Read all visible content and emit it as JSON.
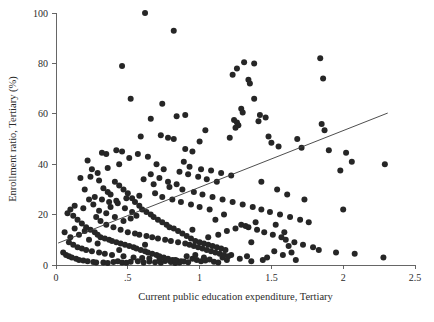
{
  "chart_data": {
    "type": "scatter",
    "title": "",
    "xlabel": "Current public education expenditure, Tertiary",
    "ylabel": "Enrollment ratio, Tertiary (%)",
    "xlim": [
      0,
      2.5
    ],
    "ylim": [
      0,
      100
    ],
    "xticks": [
      0,
      0.5,
      1,
      1.5,
      2,
      2.5
    ],
    "xtick_labels": [
      "0",
      ".5",
      "1",
      "1.5",
      "2",
      "2.5"
    ],
    "yticks": [
      0,
      20,
      40,
      60,
      80,
      100
    ],
    "ytick_labels": [
      "0",
      "20",
      "40",
      "60",
      "80",
      "100"
    ],
    "grid": false,
    "legend": null,
    "marker_color": "#262626",
    "fit_line_color": "#3a3a3a",
    "fit_line": {
      "label": "linear fit",
      "x0": 0.015,
      "y0": 8.7,
      "x1": 2.31,
      "y1": 60.3
    },
    "n_points": 305,
    "points": [
      [
        0.62,
        100.0
      ],
      [
        0.46,
        79.0
      ],
      [
        0.82,
        93.0
      ],
      [
        0.52,
        66.0
      ],
      [
        1.31,
        80.5
      ],
      [
        1.38,
        80.0
      ],
      [
        1.26,
        78.0
      ],
      [
        1.23,
        75.5
      ],
      [
        1.34,
        73.5
      ],
      [
        1.35,
        72.0
      ],
      [
        1.84,
        82.0
      ],
      [
        1.86,
        74.0
      ],
      [
        0.74,
        64.0
      ],
      [
        0.9,
        59.5
      ],
      [
        0.66,
        58.0
      ],
      [
        0.84,
        59.0
      ],
      [
        1.38,
        66.0
      ],
      [
        1.29,
        62.0
      ],
      [
        1.3,
        60.5
      ],
      [
        1.42,
        59.5
      ],
      [
        1.46,
        58.5
      ],
      [
        1.24,
        57.5
      ],
      [
        1.26,
        56.5
      ],
      [
        1.27,
        55.5
      ],
      [
        1.25,
        54.5
      ],
      [
        1.41,
        57.0
      ],
      [
        0.59,
        51.0
      ],
      [
        0.73,
        51.5
      ],
      [
        0.78,
        50.5
      ],
      [
        0.82,
        50.0
      ],
      [
        1.21,
        50.5
      ],
      [
        1.48,
        51.0
      ],
      [
        1.5,
        48.5
      ],
      [
        1.04,
        53.5
      ],
      [
        1.0,
        49.0
      ],
      [
        0.42,
        45.5
      ],
      [
        0.46,
        45.0
      ],
      [
        0.32,
        44.5
      ],
      [
        0.35,
        44.0
      ],
      [
        0.9,
        46.0
      ],
      [
        0.95,
        45.0
      ],
      [
        1.55,
        47.0
      ],
      [
        1.68,
        50.0
      ],
      [
        1.71,
        46.5
      ],
      [
        2.02,
        44.5
      ],
      [
        2.06,
        41.0
      ],
      [
        2.29,
        40.0
      ],
      [
        1.85,
        56.0
      ],
      [
        1.87,
        53.5
      ],
      [
        1.9,
        45.5
      ],
      [
        1.98,
        37.5
      ],
      [
        2.0,
        22.0
      ],
      [
        2.28,
        3.0
      ],
      [
        0.22,
        41.5
      ],
      [
        0.25,
        38.0
      ],
      [
        0.17,
        34.5
      ],
      [
        0.2,
        30.0
      ],
      [
        0.13,
        23.5
      ],
      [
        0.1,
        22.0
      ],
      [
        0.08,
        20.5
      ],
      [
        0.3,
        33.5
      ],
      [
        0.33,
        30.5
      ],
      [
        0.36,
        29.0
      ],
      [
        0.38,
        28.0
      ],
      [
        0.41,
        33.0
      ],
      [
        0.44,
        31.5
      ],
      [
        0.47,
        30.0
      ],
      [
        0.5,
        28.5
      ],
      [
        0.53,
        26.5
      ],
      [
        0.55,
        25.0
      ],
      [
        0.58,
        23.5
      ],
      [
        0.6,
        22.0
      ],
      [
        0.63,
        21.0
      ],
      [
        0.66,
        20.0
      ],
      [
        0.68,
        19.0
      ],
      [
        0.71,
        18.0
      ],
      [
        0.74,
        17.0
      ],
      [
        0.77,
        16.0
      ],
      [
        0.79,
        15.0
      ],
      [
        0.82,
        14.5
      ],
      [
        0.85,
        13.5
      ],
      [
        0.88,
        12.5
      ],
      [
        0.91,
        11.5
      ],
      [
        0.94,
        10.5
      ],
      [
        0.97,
        9.5
      ],
      [
        1.0,
        9.0
      ],
      [
        1.03,
        8.5
      ],
      [
        1.06,
        8.0
      ],
      [
        1.09,
        7.5
      ],
      [
        1.12,
        7.0
      ],
      [
        1.15,
        6.5
      ],
      [
        1.18,
        6.0
      ],
      [
        0.15,
        18.0
      ],
      [
        0.18,
        16.5
      ],
      [
        0.21,
        15.0
      ],
      [
        0.24,
        14.0
      ],
      [
        0.27,
        13.0
      ],
      [
        0.29,
        12.0
      ],
      [
        0.31,
        11.0
      ],
      [
        0.34,
        10.5
      ],
      [
        0.37,
        10.0
      ],
      [
        0.39,
        9.5
      ],
      [
        0.42,
        9.0
      ],
      [
        0.45,
        8.5
      ],
      [
        0.48,
        8.0
      ],
      [
        0.51,
        7.5
      ],
      [
        0.54,
        7.0
      ],
      [
        0.56,
        6.5
      ],
      [
        0.59,
        6.0
      ],
      [
        0.62,
        5.5
      ],
      [
        0.64,
        5.0
      ],
      [
        0.67,
        4.5
      ],
      [
        0.7,
        4.0
      ],
      [
        0.72,
        3.5
      ],
      [
        0.75,
        3.0
      ],
      [
        0.78,
        2.5
      ],
      [
        0.81,
        2.0
      ],
      [
        0.84,
        1.8
      ],
      [
        0.87,
        1.5
      ],
      [
        0.05,
        5.0
      ],
      [
        0.07,
        4.0
      ],
      [
        0.09,
        3.5
      ],
      [
        0.11,
        3.0
      ],
      [
        0.14,
        2.5
      ],
      [
        0.16,
        2.0
      ],
      [
        0.19,
        1.8
      ],
      [
        0.22,
        1.5
      ],
      [
        0.26,
        1.2
      ],
      [
        0.28,
        1.0
      ],
      [
        0.33,
        1.0
      ],
      [
        0.36,
        0.8
      ],
      [
        0.4,
        1.2
      ],
      [
        0.43,
        1.5
      ],
      [
        0.46,
        1.0
      ],
      [
        0.49,
        0.9
      ],
      [
        0.52,
        1.3
      ],
      [
        0.57,
        1.5
      ],
      [
        0.61,
        1.0
      ],
      [
        0.65,
        1.4
      ],
      [
        0.69,
        1.1
      ],
      [
        0.73,
        0.9
      ],
      [
        0.76,
        1.6
      ],
      [
        0.8,
        1.2
      ],
      [
        0.83,
        0.8
      ],
      [
        0.86,
        1.0
      ],
      [
        0.89,
        1.4
      ],
      [
        0.92,
        1.1
      ],
      [
        0.95,
        2.5
      ],
      [
        0.98,
        2.0
      ],
      [
        1.01,
        1.5
      ],
      [
        1.04,
        1.8
      ],
      [
        1.07,
        2.2
      ],
      [
        1.1,
        1.3
      ],
      [
        1.13,
        1.0
      ],
      [
        1.16,
        3.0
      ],
      [
        1.19,
        2.0
      ],
      [
        1.22,
        4.0
      ],
      [
        1.28,
        2.5
      ],
      [
        1.33,
        3.5
      ],
      [
        1.36,
        1.5
      ],
      [
        1.44,
        2.0
      ],
      [
        1.47,
        3.0
      ],
      [
        1.52,
        5.5
      ],
      [
        1.58,
        4.0
      ],
      [
        1.62,
        7.5
      ],
      [
        1.64,
        5.0
      ],
      [
        1.67,
        2.0
      ],
      [
        0.23,
        26.0
      ],
      [
        0.26,
        24.0
      ],
      [
        0.19,
        22.5
      ],
      [
        0.12,
        19.5
      ],
      [
        0.38,
        23.0
      ],
      [
        0.43,
        24.5
      ],
      [
        0.48,
        22.5
      ],
      [
        0.53,
        21.0
      ],
      [
        0.28,
        19.0
      ],
      [
        0.31,
        17.5
      ],
      [
        0.35,
        16.0
      ],
      [
        0.4,
        15.0
      ],
      [
        0.45,
        14.0
      ],
      [
        0.5,
        13.0
      ],
      [
        0.55,
        12.5
      ],
      [
        0.58,
        12.0
      ],
      [
        0.63,
        11.5
      ],
      [
        0.67,
        11.0
      ],
      [
        0.71,
        10.5
      ],
      [
        0.76,
        10.0
      ],
      [
        0.8,
        9.5
      ],
      [
        0.85,
        9.0
      ],
      [
        0.9,
        8.5
      ],
      [
        0.93,
        8.0
      ],
      [
        0.96,
        7.5
      ],
      [
        0.99,
        7.0
      ],
      [
        1.02,
        6.5
      ],
      [
        1.05,
        6.0
      ],
      [
        1.08,
        5.5
      ],
      [
        1.11,
        5.0
      ],
      [
        1.14,
        4.5
      ],
      [
        1.17,
        4.0
      ],
      [
        1.2,
        3.5
      ],
      [
        0.24,
        35.0
      ],
      [
        0.29,
        36.5
      ],
      [
        0.36,
        38.5
      ],
      [
        0.44,
        40.0
      ],
      [
        0.51,
        42.5
      ],
      [
        0.57,
        44.0
      ],
      [
        0.64,
        43.0
      ],
      [
        0.7,
        40.0
      ],
      [
        0.75,
        38.0
      ],
      [
        0.86,
        37.0
      ],
      [
        0.92,
        36.0
      ],
      [
        0.99,
        35.0
      ],
      [
        1.05,
        34.0
      ],
      [
        1.12,
        33.0
      ],
      [
        0.61,
        34.0
      ],
      [
        0.68,
        32.0
      ],
      [
        0.79,
        31.0
      ],
      [
        0.88,
        30.0
      ],
      [
        0.96,
        29.0
      ],
      [
        1.02,
        28.0
      ],
      [
        1.09,
        27.0
      ],
      [
        1.16,
        26.0
      ],
      [
        1.23,
        25.0
      ],
      [
        1.3,
        24.0
      ],
      [
        1.37,
        23.0
      ],
      [
        1.43,
        22.0
      ],
      [
        1.49,
        21.0
      ],
      [
        1.56,
        20.0
      ],
      [
        1.63,
        19.0
      ],
      [
        1.7,
        18.0
      ],
      [
        1.76,
        17.0
      ],
      [
        1.29,
        16.0
      ],
      [
        1.34,
        15.0
      ],
      [
        1.4,
        14.0
      ],
      [
        1.45,
        13.0
      ],
      [
        1.51,
        12.0
      ],
      [
        1.57,
        11.0
      ],
      [
        1.6,
        10.0
      ],
      [
        1.66,
        9.0
      ],
      [
        1.72,
        8.0
      ],
      [
        1.79,
        7.0
      ],
      [
        1.83,
        6.0
      ],
      [
        1.95,
        5.0
      ],
      [
        2.08,
        4.5
      ],
      [
        0.09,
        9.0
      ],
      [
        0.12,
        8.0
      ],
      [
        0.15,
        7.0
      ],
      [
        0.18,
        6.5
      ],
      [
        0.21,
        6.0
      ],
      [
        0.25,
        5.5
      ],
      [
        0.3,
        5.0
      ],
      [
        0.34,
        4.5
      ],
      [
        0.39,
        4.0
      ],
      [
        0.47,
        3.5
      ],
      [
        0.54,
        3.0
      ],
      [
        0.6,
        2.8
      ],
      [
        0.65,
        2.6
      ],
      [
        0.72,
        2.4
      ],
      [
        0.77,
        2.2
      ],
      [
        0.83,
        2.0
      ],
      [
        0.91,
        3.5
      ],
      [
        0.97,
        4.0
      ],
      [
        1.03,
        3.0
      ],
      [
        1.06,
        11.0
      ],
      [
        1.13,
        12.0
      ],
      [
        1.19,
        13.5
      ],
      [
        1.25,
        14.5
      ],
      [
        1.32,
        15.5
      ],
      [
        1.39,
        17.0
      ],
      [
        0.47,
        17.5
      ],
      [
        0.52,
        18.5
      ],
      [
        0.56,
        19.5
      ],
      [
        0.41,
        19.0
      ],
      [
        0.35,
        20.5
      ],
      [
        0.3,
        21.5
      ],
      [
        0.27,
        27.0
      ],
      [
        0.32,
        26.0
      ],
      [
        0.37,
        25.0
      ],
      [
        0.42,
        25.5
      ],
      [
        0.49,
        26.5
      ],
      [
        0.58,
        27.5
      ],
      [
        0.69,
        28.5
      ],
      [
        0.74,
        27.0
      ],
      [
        0.81,
        26.0
      ],
      [
        0.87,
        25.0
      ],
      [
        0.94,
        24.0
      ],
      [
        1.0,
        23.0
      ],
      [
        1.07,
        22.0
      ],
      [
        0.66,
        36.0
      ],
      [
        0.72,
        34.5
      ],
      [
        0.78,
        33.0
      ],
      [
        0.84,
        32.0
      ],
      [
        0.89,
        41.0
      ],
      [
        0.93,
        39.0
      ],
      [
        1.01,
        38.0
      ],
      [
        1.08,
        37.5
      ],
      [
        1.15,
        36.5
      ],
      [
        1.22,
        35.5
      ],
      [
        1.43,
        33.0
      ],
      [
        1.54,
        30.0
      ],
      [
        1.61,
        28.0
      ],
      [
        1.73,
        26.0
      ],
      [
        0.16,
        12.0
      ],
      [
        0.23,
        10.0
      ],
      [
        0.29,
        8.5
      ],
      [
        0.44,
        6.0
      ],
      [
        0.62,
        8.0
      ],
      [
        0.95,
        14.0
      ],
      [
        1.11,
        18.0
      ],
      [
        1.17,
        20.0
      ],
      [
        1.36,
        9.0
      ],
      [
        1.53,
        16.0
      ],
      [
        1.59,
        13.0
      ],
      [
        0.06,
        13.0
      ],
      [
        0.1,
        11.0
      ],
      [
        0.13,
        14.5
      ],
      [
        0.2,
        13.5
      ]
    ]
  },
  "axes": {
    "x_title": "Current public education expenditure, Tertiary",
    "y_title": "Enrollment ratio, Tertiary (%)"
  }
}
